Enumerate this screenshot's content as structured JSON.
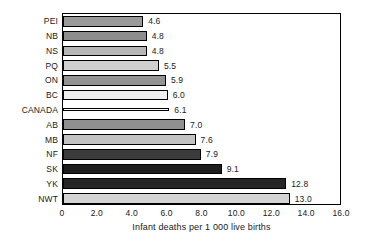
{
  "chart_data": {
    "type": "bar",
    "orientation": "horizontal",
    "title": "",
    "xlabel": "Infant deaths per 1 000 live births",
    "ylabel": "",
    "xlim": [
      0,
      16.0
    ],
    "xticks": [
      "0",
      "2.0",
      "4.0",
      "6.0",
      "8.0",
      "10.0",
      "12.0",
      "14.0",
      "16.0"
    ],
    "xtick_values": [
      0,
      2,
      4,
      6,
      8,
      10,
      12,
      14,
      16
    ],
    "grid": false,
    "legend": false,
    "categories": [
      "PEI",
      "NB",
      "NS",
      "PQ",
      "ON",
      "BC",
      "CANADA",
      "AB",
      "MB",
      "NF",
      "SK",
      "YK",
      "NWT"
    ],
    "values": [
      4.6,
      4.8,
      4.8,
      5.5,
      5.9,
      6.0,
      6.1,
      7.0,
      7.6,
      7.9,
      9.1,
      12.8,
      13.0
    ],
    "value_labels": [
      "4.6",
      "4.8",
      "4.8",
      "5.5",
      "5.9",
      "6.0",
      "6.1",
      "7.0",
      "7.6",
      "7.9",
      "9.1",
      "12.8",
      "13.0"
    ],
    "bars": [
      {
        "category": "PEI",
        "value": 4.6,
        "label": "4.6",
        "fill": "#9a9a9a",
        "style": "filled"
      },
      {
        "category": "NB",
        "value": 4.8,
        "label": "4.8",
        "fill": "#8d8d8d",
        "style": "filled"
      },
      {
        "category": "NS",
        "value": 4.8,
        "label": "4.8",
        "fill": "#b6b6b6",
        "style": "filled"
      },
      {
        "category": "PQ",
        "value": 5.5,
        "label": "5.5",
        "fill": "#cfcfcf",
        "style": "filled"
      },
      {
        "category": "ON",
        "value": 5.9,
        "label": "5.9",
        "fill": "#939393",
        "style": "filled"
      },
      {
        "category": "BC",
        "value": 6.0,
        "label": "6.0",
        "fill": "#efefef",
        "style": "filled"
      },
      {
        "category": "CANADA",
        "value": 6.1,
        "label": "6.1",
        "fill": "#ffffff",
        "style": "flat"
      },
      {
        "category": "AB",
        "value": 7.0,
        "label": "7.0",
        "fill": "#8f8f8f",
        "style": "filled"
      },
      {
        "category": "MB",
        "value": 7.6,
        "label": "7.6",
        "fill": "#c2c2c2",
        "style": "filled"
      },
      {
        "category": "NF",
        "value": 7.9,
        "label": "7.9",
        "fill": "#3b3b3b",
        "style": "filled"
      },
      {
        "category": "SK",
        "value": 9.1,
        "label": "9.1",
        "fill": "#1d1d1d",
        "style": "filled"
      },
      {
        "category": "YK",
        "value": 12.8,
        "label": "12.8",
        "fill": "#262626",
        "style": "filled"
      },
      {
        "category": "NWT",
        "value": 13.0,
        "label": "13.0",
        "fill": "#d4d4d4",
        "style": "filled"
      }
    ],
    "colors": {
      "frame": "#000000",
      "text": "#1a1a1a",
      "background": "#ffffff"
    }
  }
}
